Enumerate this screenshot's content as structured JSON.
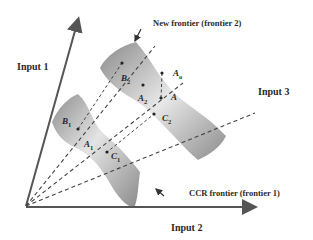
{
  "diagram": {
    "type": "DEA frontier projection diagram",
    "axes": [
      {
        "id": "input1",
        "label": "Input 1"
      },
      {
        "id": "input2",
        "label": "Input 2"
      },
      {
        "id": "input3",
        "label": "Input 3"
      }
    ],
    "frontiers": [
      {
        "id": "frontier1",
        "label": "CCR frontier (frontier 1)"
      },
      {
        "id": "frontier2",
        "label": "New frontier (frontier 2)"
      }
    ],
    "points": {
      "B1": {
        "main": "B",
        "sub": "1"
      },
      "A1": {
        "main": "A",
        "sub": "1"
      },
      "C1": {
        "main": "C",
        "sub": "1"
      },
      "B2": {
        "main": "B",
        "sub": "2"
      },
      "A2": {
        "main": "A",
        "sub": "2"
      },
      "C2": {
        "main": "C",
        "sub": "2"
      },
      "A": {
        "main": "A",
        "sub": ""
      },
      "Ao": {
        "main": "A",
        "sub": "o"
      }
    },
    "colors": {
      "axis": "#555555",
      "surface_dark": "#8a8a8a",
      "surface_light": "#e6e6e6",
      "dash": "#444444",
      "text": "#2a2a2a"
    }
  }
}
